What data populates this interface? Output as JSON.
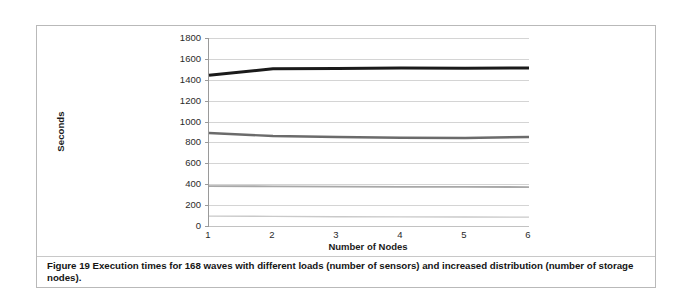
{
  "figure": {
    "caption": "Figure 19 Execution times for 168 waves with different loads (number of sensors) and increased distribution (number of storage nodes)."
  },
  "chart_data": {
    "type": "line",
    "title": "",
    "xlabel": "Number of Nodes",
    "ylabel": "Seconds",
    "x": [
      1,
      2,
      3,
      4,
      5,
      6
    ],
    "categories": [
      "1",
      "2",
      "3",
      "4",
      "5",
      "6"
    ],
    "xlim": [
      1,
      6
    ],
    "ylim": [
      0,
      1800
    ],
    "yticks": [
      0,
      200,
      400,
      600,
      800,
      1000,
      1200,
      1400,
      1600,
      1800
    ],
    "ytick_labels": [
      "0",
      "200",
      "400",
      "600",
      "800",
      "1000",
      "1200",
      "1400",
      "1600",
      "1800"
    ],
    "grid": "horizontal",
    "legend_position": "bottom",
    "series": [
      {
        "name": "2500",
        "values": [
          95,
          92,
          89,
          87,
          86,
          85
        ],
        "color": "#c9c9c9",
        "width": 1.4
      },
      {
        "name": "10000",
        "values": [
          382,
          380,
          377,
          375,
          374,
          373
        ],
        "color": "#a8a8a8",
        "width": 1.8
      },
      {
        "name": "22500",
        "values": [
          890,
          862,
          852,
          845,
          843,
          852
        ],
        "color": "#6b6b6b",
        "width": 2.4
      },
      {
        "name": "40000",
        "values": [
          1443,
          1505,
          1508,
          1512,
          1510,
          1513
        ],
        "color": "#1a1a1a",
        "width": 3.0
      }
    ]
  },
  "colors": {
    "frame_border": "#b9b9b9",
    "gridline": "#d4d4d4",
    "axis": "#9a9a9a",
    "text": "#2a2a2a",
    "background": "#ffffff"
  }
}
